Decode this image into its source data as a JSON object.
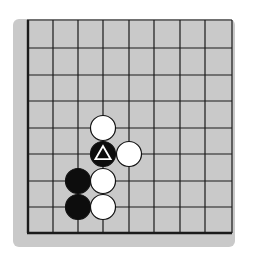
{
  "diagram": {
    "type": "go-board-fragment",
    "colors": {
      "page_background": "#ffffff",
      "board_background": "#c9c9c9",
      "grid_line": "#1a1a1a",
      "black_stone": "#0d0d0d",
      "white_stone": "#ffffff",
      "stone_outline": "#111111",
      "marker": "#ffffff"
    },
    "board": {
      "background_rect": {
        "x": 13,
        "y": 19,
        "width": 222,
        "height": 228,
        "radius": 6
      },
      "grid": {
        "x_lines": [
          28,
          53,
          78,
          103,
          129,
          154,
          180,
          205,
          232
        ],
        "y_lines": [
          20,
          48,
          75,
          101,
          128,
          154,
          181,
          207,
          233
        ]
      },
      "edges_thick": [
        "left",
        "bottom"
      ]
    },
    "stones": [
      {
        "color": "white",
        "col": 3,
        "row": 4,
        "marker": null
      },
      {
        "color": "black",
        "col": 3,
        "row": 5,
        "marker": "triangle"
      },
      {
        "color": "white",
        "col": 4,
        "row": 5,
        "marker": null
      },
      {
        "color": "black",
        "col": 2,
        "row": 6,
        "marker": null
      },
      {
        "color": "white",
        "col": 3,
        "row": 6,
        "marker": null
      },
      {
        "color": "black",
        "col": 2,
        "row": 7,
        "marker": null
      },
      {
        "color": "white",
        "col": 3,
        "row": 7,
        "marker": null
      }
    ],
    "stone_radius": 12.5
  }
}
